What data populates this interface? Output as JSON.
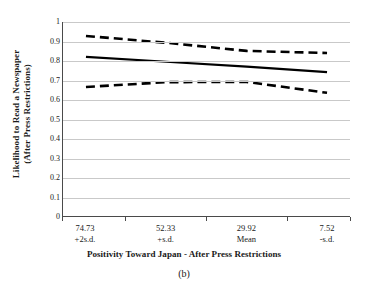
{
  "chart_data": {
    "type": "line",
    "title": "",
    "caption": "(b)",
    "xlabel": "Positivity Toward Japan - After Press Restrictions",
    "ylabel_line1": "Likelihood to Read a Newspaper",
    "ylabel_line2": "(After Press Restrictions)",
    "ylim": [
      0,
      1
    ],
    "yticks": [
      "1",
      "0.9",
      "0.8",
      "0.7",
      "0.6",
      "0.5",
      "0.4",
      "0.3",
      "0.2",
      "0.1",
      "0"
    ],
    "ytick_values": [
      1,
      0.9,
      0.8,
      0.7,
      0.6,
      0.5,
      0.4,
      0.3,
      0.2,
      0.1,
      0
    ],
    "grid": "horizontal",
    "legend": "none",
    "categories": [
      "74.73",
      "52.33",
      "29.92",
      "7.52"
    ],
    "category_sublabels": [
      "+2s.d.",
      "+s.d.",
      "Mean",
      "-s.d."
    ],
    "x_positions": [
      0.08,
      0.36,
      0.64,
      0.92
    ],
    "series": [
      {
        "name": "upper-confidence-band",
        "style": "dashed",
        "color": "#000000",
        "values": [
          0.928,
          0.893,
          0.851,
          0.84
        ]
      },
      {
        "name": "predicted-likelihood",
        "style": "solid",
        "color": "#000000",
        "values": [
          0.82,
          0.795,
          0.77,
          0.742
        ]
      },
      {
        "name": "lower-confidence-band",
        "style": "dashed",
        "color": "#000000",
        "values": [
          0.665,
          0.69,
          0.691,
          0.635
        ]
      }
    ],
    "axis_color": "#4a4a4a",
    "grid_color": "#c9c9c9"
  },
  "figure": {
    "y_axis_title_line1": "Likelihood to Read a Newspaper",
    "y_axis_title_line2": "(After Press Restrictions)",
    "x_axis_title": "Positivity Toward Japan - After Press Restrictions",
    "caption": "(b)"
  }
}
